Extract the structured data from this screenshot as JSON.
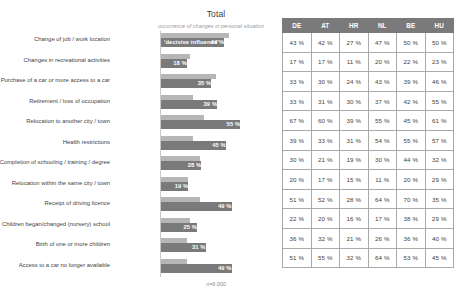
{
  "chart_block": {
    "title": "Total",
    "subtitle": "occurrence of changes in personal situation",
    "first_bar_tag": "'decisive influence'",
    "note": "n=6.000"
  },
  "table": {
    "columns": [
      "DE",
      "AT",
      "HR",
      "NL",
      "BE",
      "HU"
    ]
  },
  "chart_data": {
    "type": "bar",
    "orientation": "horizontal",
    "title": "Total",
    "subtitle": "occurrence of changes in personal situation",
    "xlabel": "",
    "ylabel": "",
    "xlim": [
      0,
      75
    ],
    "grid": false,
    "legend": [
      "occurrence of changes in personal situation",
      "'decisive influence'"
    ],
    "note": "n=6.000",
    "categories": [
      "Change of job / work location",
      "Changes in recreational activities",
      "Purchase of a car or more access to a car",
      "Retirement / loss of occupation",
      "Relocation to another city / town",
      "Health restrictions",
      "Completion of schooling / training / degree",
      "Relocation within the same city / town",
      "Receipt of driving licence",
      "Children began/changed (nursery) school",
      "Birth of one or more children",
      "Access to a car no longer available"
    ],
    "series": [
      {
        "name": "occurrence of changes in personal situation",
        "values": [
          47,
          20,
          38,
          22,
          30,
          22,
          27,
          19,
          27,
          20,
          18,
          18
        ]
      },
      {
        "name": "'decisive influence'",
        "values": [
          44,
          18,
          35,
          39,
          55,
          45,
          28,
          19,
          49,
          25,
          31,
          49
        ]
      }
    ],
    "value_labels": [
      "44 %",
      "18 %",
      "35 %",
      "39 %",
      "55 %",
      "45 %",
      "28 %",
      "19 %",
      "49 %",
      "25 %",
      "31 %",
      "49 %"
    ],
    "table": {
      "columns": [
        "DE",
        "AT",
        "HR",
        "NL",
        "BE",
        "HU"
      ],
      "rows": [
        [
          "43 %",
          "42 %",
          "27 %",
          "47 %",
          "50 %",
          "50 %"
        ],
        [
          "17 %",
          "17 %",
          "11 %",
          "20 %",
          "22 %",
          "23 %"
        ],
        [
          "33 %",
          "30 %",
          "24 %",
          "43 %",
          "39 %",
          "46 %"
        ],
        [
          "33 %",
          "31 %",
          "30 %",
          "37 %",
          "42 %",
          "55 %"
        ],
        [
          "67 %",
          "60 %",
          "39 %",
          "55 %",
          "45 %",
          "61 %"
        ],
        [
          "39 %",
          "33 %",
          "31 %",
          "54 %",
          "55 %",
          "57 %"
        ],
        [
          "30 %",
          "21 %",
          "19 %",
          "30 %",
          "44 %",
          "32 %"
        ],
        [
          "20 %",
          "17 %",
          "15 %",
          "11 %",
          "20 %",
          "29 %"
        ],
        [
          "51 %",
          "52 %",
          "28 %",
          "64 %",
          "70 %",
          "35 %"
        ],
        [
          "22 %",
          "20 %",
          "16 %",
          "17 %",
          "38 %",
          "29 %"
        ],
        [
          "36 %",
          "32 %",
          "21 %",
          "26 %",
          "36 %",
          "40 %"
        ],
        [
          "51 %",
          "55 %",
          "32 %",
          "64 %",
          "53 %",
          "45 %"
        ]
      ]
    }
  },
  "colors": {
    "bar_dark": "#7a7a7a",
    "bar_light": "#b6b6b6",
    "header_bg": "#7a7a7a",
    "text": "#3f3f3f"
  }
}
